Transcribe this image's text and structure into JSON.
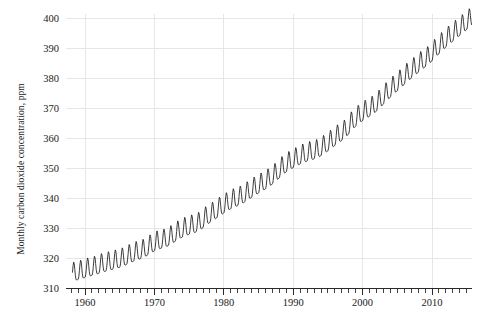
{
  "chart_data": {
    "type": "line",
    "title": "",
    "subtitle": "",
    "xlabel": "",
    "ylabel": "Monthly carbon dioxide concentration, ppm",
    "xlim": [
      1957.5,
      2016.0
    ],
    "ylim": [
      310,
      403
    ],
    "grid": true,
    "legend": null,
    "legend_position": "none",
    "line_color": "#1b1b1b",
    "grid_color": "#e6e6e6",
    "axis_color": "#2b2b2b",
    "background_color": "#ffffff",
    "x_ticks_major": [
      1960,
      1970,
      1980,
      1990,
      2000,
      2010
    ],
    "x_tick_labels": [
      "1960",
      "1970",
      "1980",
      "1990",
      "2000",
      "2010"
    ],
    "x_tick_minor_step": 1,
    "y_ticks": [
      310,
      320,
      330,
      340,
      350,
      360,
      370,
      380,
      390,
      400
    ],
    "y_tick_labels": [
      "310",
      "320",
      "330",
      "340",
      "350",
      "360",
      "370",
      "380",
      "390",
      "400"
    ],
    "seasonal_amplitude_ppm": 3.1,
    "series": [
      {
        "name": "Monthly mean CO2 (Mauna Loa)",
        "x": [
          1958.2,
          1958.7,
          1959.2,
          1959.7,
          1960.2,
          1960.7,
          1961.2,
          1961.7,
          1962.2,
          1962.7,
          1963.2,
          1963.7,
          1964.2,
          1964.7,
          1965.2,
          1965.7,
          1966.2,
          1966.7,
          1967.2,
          1967.7,
          1968.2,
          1968.7,
          1969.2,
          1969.7,
          1970.2,
          1970.7,
          1971.2,
          1971.7,
          1972.2,
          1972.7,
          1973.2,
          1973.7,
          1974.2,
          1974.7,
          1975.2,
          1975.7,
          1976.2,
          1976.7,
          1977.2,
          1977.7,
          1978.2,
          1978.7,
          1979.2,
          1979.7,
          1980.2,
          1980.7,
          1981.2,
          1981.7,
          1982.2,
          1982.7,
          1983.2,
          1983.7,
          1984.2,
          1984.7,
          1985.2,
          1985.7,
          1986.2,
          1986.7,
          1987.2,
          1987.7,
          1988.2,
          1988.7,
          1989.2,
          1989.7,
          1990.2,
          1990.7,
          1991.2,
          1991.7,
          1992.2,
          1992.7,
          1993.2,
          1993.7,
          1994.2,
          1994.7,
          1995.2,
          1995.7,
          1996.2,
          1996.7,
          1997.2,
          1997.7,
          1998.2,
          1998.7,
          1999.2,
          1999.7,
          2000.2,
          2000.7,
          2001.2,
          2001.7,
          2002.2,
          2002.7,
          2003.2,
          2003.7,
          2004.2,
          2004.7,
          2005.2,
          2005.7,
          2006.2,
          2006.7,
          2007.2,
          2007.7,
          2008.2,
          2008.7,
          2009.2,
          2009.7,
          2010.2,
          2010.7,
          2011.2,
          2011.7,
          2012.2,
          2012.7,
          2013.2,
          2013.7,
          2014.2,
          2014.7,
          2015.2,
          2015.7
        ],
        "y": [
          315.7,
          314.0,
          316.3,
          314.6,
          317.2,
          315.3,
          317.6,
          316.0,
          318.6,
          316.8,
          319.2,
          317.4,
          319.8,
          318.0,
          320.5,
          318.7,
          321.8,
          319.7,
          322.7,
          320.8,
          323.5,
          321.4,
          325.0,
          323.0,
          326.3,
          324.3,
          326.8,
          324.9,
          328.0,
          326.1,
          329.7,
          327.6,
          331.0,
          328.6,
          331.8,
          329.4,
          332.6,
          330.3,
          334.6,
          332.2,
          336.1,
          333.7,
          337.8,
          335.3,
          339.3,
          336.8,
          340.6,
          338.1,
          341.4,
          339.0,
          343.0,
          340.4,
          344.5,
          342.0,
          346.0,
          343.2,
          347.3,
          344.7,
          349.2,
          346.5,
          351.5,
          348.8,
          353.2,
          350.4,
          354.5,
          351.6,
          355.6,
          352.9,
          356.4,
          353.7,
          357.1,
          354.3,
          358.5,
          355.8,
          360.3,
          357.5,
          362.2,
          359.2,
          363.7,
          360.8,
          366.5,
          363.7,
          368.6,
          365.9,
          370.3,
          367.5,
          371.6,
          368.8,
          373.7,
          370.9,
          376.3,
          373.3,
          378.5,
          375.4,
          380.6,
          377.5,
          382.9,
          379.6,
          384.8,
          381.5,
          386.8,
          383.5,
          388.2,
          385.3,
          391.0,
          387.5,
          393.1,
          389.9,
          395.3,
          392.0,
          397.2,
          393.9,
          399.0,
          395.9,
          401.6,
          397.2
        ]
      }
    ]
  },
  "axis": {
    "ylabel": "Monthly carbon dioxide concentration, ppm"
  }
}
